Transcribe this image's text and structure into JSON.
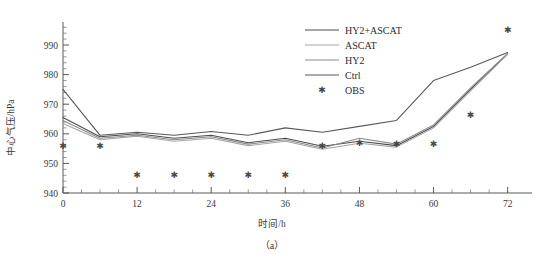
{
  "figure": {
    "caption": "（a）",
    "panel_id": "a"
  },
  "axes": {
    "y_title": "中心气压/hPa",
    "x_title": "时间/h",
    "y_ticks": [
      "940",
      "950",
      "960",
      "970",
      "980",
      "990"
    ],
    "x_ticks": [
      "0",
      "12",
      "24",
      "36",
      "48",
      "60",
      "72"
    ]
  },
  "legend": {
    "items": [
      {
        "label": "HY2+ASCAT",
        "color": "#4d4d4d",
        "marker": "line"
      },
      {
        "label": "ASCAT",
        "color": "#a6a6a6",
        "marker": "line"
      },
      {
        "label": "HY2",
        "color": "#8c8c8c",
        "marker": "line"
      },
      {
        "label": "Ctrl",
        "color": "#595959",
        "marker": "line"
      },
      {
        "label": "OBS",
        "color": "#4a4a4a",
        "marker": "asterisk"
      }
    ]
  },
  "chart_data": {
    "type": "line",
    "title": "",
    "xlabel": "时间/h",
    "ylabel": "中心气压/hPa",
    "xlim": [
      0,
      74
    ],
    "ylim": [
      940,
      997
    ],
    "grid": false,
    "legend_position": "top-right",
    "x": [
      0,
      6,
      12,
      18,
      24,
      30,
      36,
      42,
      48,
      54,
      60,
      66,
      72
    ],
    "series": [
      {
        "name": "Ctrl",
        "color": "#595959",
        "width": 1.1,
        "values": [
          975.0,
          959.5,
          960.5,
          959.5,
          960.8,
          959.5,
          962.0,
          960.5,
          962.5,
          964.5,
          978.0,
          982.5,
          987.5
        ]
      },
      {
        "name": "HY2+ASCAT",
        "color": "#4d4d4d",
        "width": 1.1,
        "values": [
          965.5,
          959.0,
          960.0,
          958.5,
          959.5,
          957.0,
          958.5,
          955.8,
          957.5,
          956.0,
          962.5,
          975.0,
          987.0
        ]
      },
      {
        "name": "HY2",
        "color": "#8c8c8c",
        "width": 1.1,
        "values": [
          964.5,
          958.5,
          959.5,
          958.0,
          959.0,
          956.5,
          958.0,
          955.2,
          958.5,
          956.5,
          963.0,
          975.5,
          987.2
        ]
      },
      {
        "name": "ASCAT",
        "color": "#a6a6a6",
        "width": 1.1,
        "values": [
          963.5,
          958.0,
          959.2,
          957.5,
          958.5,
          956.0,
          957.5,
          954.8,
          956.8,
          955.5,
          962.0,
          974.5,
          986.8
        ]
      }
    ],
    "scatter": {
      "name": "OBS",
      "marker": "asterisk",
      "color": "#4a4a4a",
      "points": [
        {
          "x": 0,
          "y": 956.0
        },
        {
          "x": 6,
          "y": 956.0
        },
        {
          "x": 12,
          "y": 946.0
        },
        {
          "x": 18,
          "y": 946.0
        },
        {
          "x": 24,
          "y": 946.0
        },
        {
          "x": 30,
          "y": 946.0
        },
        {
          "x": 36,
          "y": 946.0
        },
        {
          "x": 42,
          "y": 956.0
        },
        {
          "x": 48,
          "y": 957.0
        },
        {
          "x": 54,
          "y": 956.5
        },
        {
          "x": 60,
          "y": 956.5
        },
        {
          "x": 66,
          "y": 966.5
        },
        {
          "x": 72,
          "y": 995.0
        }
      ]
    }
  }
}
